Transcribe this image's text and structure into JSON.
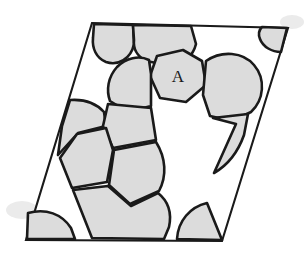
{
  "figure": {
    "kind": "microstructure-schematic",
    "background_color": "#ffffff",
    "line_color": "#1a1a1a",
    "grain_fill_color": "#dcdcdc",
    "canvas": {
      "width": 306,
      "height": 257
    }
  },
  "cell": {
    "name": "parallelogram-boundary",
    "shape": "parallelogram",
    "corners": [
      {
        "name": "top-left",
        "x": 92,
        "y": 23
      },
      {
        "name": "top-right",
        "x": 288,
        "y": 28
      },
      {
        "name": "bottom-right",
        "x": 222,
        "y": 241
      },
      {
        "name": "bottom-left",
        "x": 26,
        "y": 240
      }
    ],
    "path": "M 92 23 L 288 28 L 222 241 L 26 240 Z",
    "stroke_width": 2.1
  },
  "labels": {
    "grain_a": "A",
    "grain_a_x": 178,
    "grain_a_y": 78
  },
  "grains": [
    {
      "id": "grain-top-left-lobe",
      "label": "",
      "description": "rounded grain hanging from the top edge at the left",
      "path": "M 94 24 L 133 25 L 134 44 C 131 59 118 66 106 62 C 96 58 92 48 93 38 Z"
    },
    {
      "id": "grain-top-center",
      "label": "",
      "description": "large grain hanging from the top edge, centre-left",
      "path": "M 133 25 L 191 26 L 196 44 C 193 56 185 63 172 66 L 146 61 C 137 56 133 49 134 40 Z"
    },
    {
      "id": "grain-top-right-corner",
      "label": "",
      "description": "corner grain wedged at the top-right vertex",
      "path": "M 262 27 L 287 28 L 281 52 C 272 52 263 47 260 39 C 258 34 259 30 262 27 Z"
    },
    {
      "id": "grain-a",
      "label": "A",
      "description": "central labelled grain, irregular hexagon, marked A",
      "path": "M 157 56 L 183 50 L 202 61 L 206 85 L 186 102 L 160 98 L 150 76 Z"
    },
    {
      "id": "grain-right-round",
      "label": "",
      "description": "large rounded grain right of grain A",
      "path": "M 206 61 C 222 50 243 52 254 65 C 266 79 264 100 251 112 L 232 121 L 210 116 L 203 95 Z"
    },
    {
      "id": "grain-right-crescent",
      "label": "",
      "description": "crescent grain touching the right edge below the round grain",
      "path": "M 213 118 L 248 114 L 244 135 C 238 152 228 165 214 173 L 236 124 Z"
    },
    {
      "id": "grain-upper-mid-left",
      "label": "",
      "description": "grain to the left of grain A, upper middle chain",
      "path": "M 151 74 L 149 60 C 139 55 126 58 117 67 C 108 77 106 90 110 101 L 128 112 L 151 106 Z"
    },
    {
      "id": "grain-left-wedge",
      "label": "",
      "description": "wedge grain pressed against the left edge",
      "path": "M 70 100 C 84 99 96 103 104 112 L 106 126 L 78 133 L 58 155 L 62 126 Z"
    },
    {
      "id": "grain-mid-chain-upper",
      "label": "",
      "description": "quadrilateral grain in the middle diagonal chain",
      "path": "M 108 104 L 151 108 L 156 140 L 113 148 L 103 126 Z"
    },
    {
      "id": "grain-mid-chain-left",
      "label": "",
      "description": "grain left of the middle chain, touching the left edge",
      "path": "M 77 134 L 106 128 L 113 150 L 107 182 L 72 188 L 60 158 Z"
    },
    {
      "id": "grain-mid-chain-lower",
      "label": "",
      "description": "large rounded grain in the lower middle chain",
      "path": "M 114 150 L 156 142 C 166 158 167 176 159 191 L 130 204 L 109 185 Z"
    },
    {
      "id": "grain-lower-chain",
      "label": "",
      "description": "grain of the lower chain reaching the bottom edge",
      "path": "M 108 186 L 131 206 L 158 193 C 168 201 172 213 169 227 L 164 239 L 92 238 L 73 190 Z"
    },
    {
      "id": "grain-bottom-left-corner",
      "label": "",
      "description": "corner grain at the bottom-left vertex, rounded top",
      "path": "M 27 239 L 28 213 C 46 208 62 214 71 228 L 75 239 Z"
    },
    {
      "id": "grain-bottom-right-corner",
      "label": "",
      "description": "quarter-disc grain in the bottom-right corner",
      "path": "M 222 240 L 177 239 C 178 221 190 207 207 203 Z"
    }
  ]
}
